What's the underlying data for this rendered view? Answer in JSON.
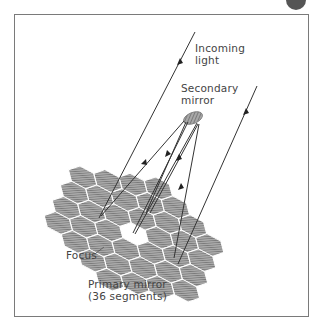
{
  "diagram": {
    "type": "segmented-mirror telescope optics",
    "labels": {
      "incoming_light": [
        "Incoming",
        "light"
      ],
      "secondary_mirror": [
        "Secondary",
        "mirror"
      ],
      "focus": "Focus",
      "primary_mirror": [
        "Primary mirror",
        "(36 segments)"
      ]
    },
    "colors": {
      "frame": "#7a7a7a",
      "ray": "#333333",
      "mirror_fill": "#8c8c8c",
      "text": "#444444"
    },
    "primary_mirror_segments": 36
  }
}
